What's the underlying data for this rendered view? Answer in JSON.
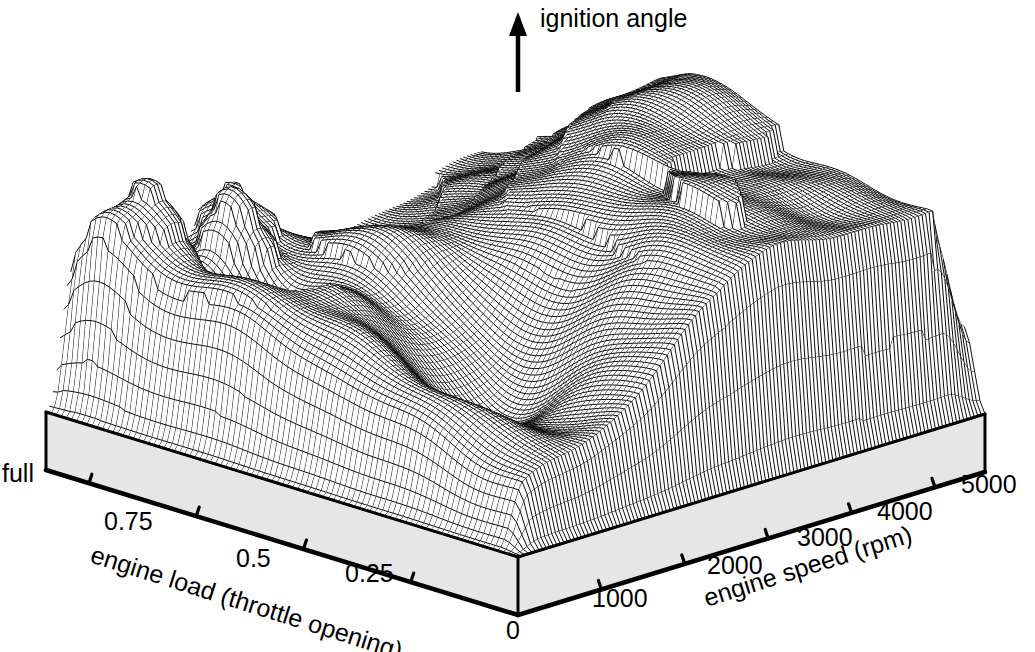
{
  "chart_data": {
    "type": "surface",
    "title": "",
    "zlabel": "ignition angle",
    "xlabel": "engine speed (rpm)",
    "ylabel": "engine load (throttle opening)",
    "origin_label": "0",
    "xticklabels": [
      "1000",
      "2000",
      "3000",
      "4000",
      "5000"
    ],
    "xtickvalues": [
      1000,
      2000,
      3000,
      4000,
      5000
    ],
    "xlim": [
      0,
      5600
    ],
    "yticklabels": [
      "full",
      "0.75",
      "0.5",
      "0.25"
    ],
    "ytickvalues": [
      1.0,
      0.75,
      0.5,
      0.25
    ],
    "ylim": [
      0,
      1.1
    ],
    "zlim": [
      0,
      1
    ],
    "grid": true,
    "legend": false,
    "mesh": {
      "nx": 64,
      "ny": 46,
      "style": "wireframe-hidden-line"
    },
    "colors": {
      "line": "#000000",
      "background": "#ffffff",
      "pedestal": "#e6e6e6",
      "pedestal_edge": "#000000"
    },
    "x": [
      0,
      175,
      350,
      525,
      700,
      875,
      1050,
      1225,
      1400,
      1575,
      1750,
      1925,
      2100,
      2275,
      2450,
      2625,
      2800,
      2975,
      3150,
      3325,
      3500,
      3675,
      3850,
      4025,
      4200,
      4375,
      4550,
      4725,
      4900,
      5075,
      5250,
      5425,
      5600
    ],
    "y": [
      0,
      0.0344,
      0.0688,
      0.1031,
      0.1375,
      0.1719,
      0.2063,
      0.2406,
      0.275,
      0.3094,
      0.3438,
      0.3781,
      0.4125,
      0.4469,
      0.4813,
      0.5156,
      0.55,
      0.5844,
      0.6188,
      0.6531,
      0.6875,
      0.7219,
      0.7563,
      0.7906,
      0.825,
      0.8594,
      0.8938,
      0.9281,
      0.9625,
      0.9969,
      1.03,
      1.065,
      1.1
    ],
    "z_note": "Surface heights are generated procedurally in the renderer to reproduce the published ignition map relief: a broad high plateau over mid-to-high engine speed, deep terraced steps toward full load on the right flank, several sharp ridges and a pair of narrow peaks over the low-speed / high-load corner, and a trough running diagonally through the centre.",
    "z_min": 0.0,
    "z_max": 1.0
  }
}
